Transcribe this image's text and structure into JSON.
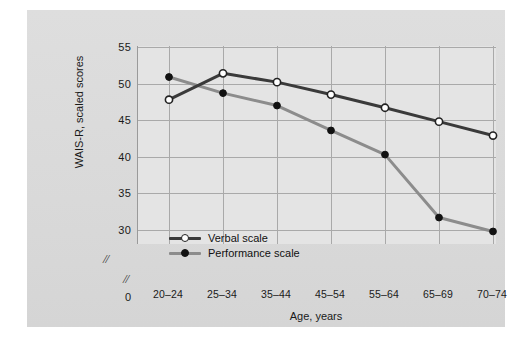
{
  "chart_data": {
    "type": "line",
    "title": "",
    "xlabel": "Age, years",
    "ylabel": "WAIS-R, scaled scores",
    "categories": [
      "20–24",
      "25–34",
      "35–44",
      "45–54",
      "55–64",
      "65–69",
      "70–74"
    ],
    "yticks": [
      "55",
      "50",
      "45",
      "40",
      "35",
      "30"
    ],
    "ytick_values": [
      55,
      50,
      45,
      40,
      35,
      30
    ],
    "y_origin_label": "0",
    "ylim": [
      30,
      55
    ],
    "grid": true,
    "axis_break_y": "//",
    "axis_break_x": "//",
    "legend_position": "inside bottom-left",
    "series": [
      {
        "name": "Verbal scale",
        "marker": "open-circle",
        "color": "#3a3a3a",
        "values": [
          47.8,
          51.4,
          50.2,
          48.5,
          46.7,
          44.8,
          42.9
        ]
      },
      {
        "name": "Performance scale",
        "marker": "filled-circle",
        "color": "#8c8c8c",
        "values": [
          50.9,
          48.7,
          47.0,
          43.6,
          40.3,
          31.7,
          29.8
        ]
      }
    ]
  },
  "colors": {
    "page_background": "#ffffff",
    "card_background": "#dcdcdc",
    "plot_background": "#e4e4e4",
    "gridline": "#a9a9a9",
    "verbal_series": "#3a3a3a",
    "performance_series": "#8c8c8c",
    "text": "#1a1a1a"
  }
}
